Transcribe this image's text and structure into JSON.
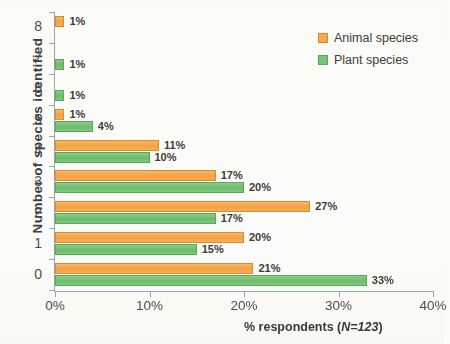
{
  "chart_data": {
    "type": "bar",
    "orientation": "horizontal",
    "title": "",
    "xlabel": "% respondents (N=123)",
    "xlabel_plain": "% respondents (",
    "xlabel_italic": "N=123",
    "xlabel_tail": ")",
    "ylabel": "Number of species identified",
    "categories": [
      "0",
      "1",
      "2",
      "3",
      "4",
      "5",
      "6",
      "7",
      "8"
    ],
    "xlim": [
      0,
      40
    ],
    "xticks": [
      0,
      10,
      20,
      30,
      40
    ],
    "xtick_labels": [
      "0%",
      "10%",
      "20%",
      "30%",
      "40%"
    ],
    "ytick_labels": [
      "8",
      "7",
      "6",
      "5",
      "4",
      "3",
      "2",
      "1",
      "0"
    ],
    "grid": false,
    "legend_position": "top-right",
    "series": [
      {
        "name": "Animal species",
        "color": "#F6A94E",
        "values": [
          21,
          20,
          27,
          17,
          11,
          1,
          null,
          null,
          1
        ],
        "labels": [
          "21%",
          "20%",
          "27%",
          "17%",
          "11%",
          "1%",
          "",
          "",
          "1%"
        ]
      },
      {
        "name": "Plant species",
        "color": "#79C477",
        "values": [
          33,
          15,
          17,
          20,
          10,
          4,
          1,
          1,
          null
        ],
        "labels": [
          "33%",
          "15%",
          "17%",
          "20%",
          "10%",
          "4%",
          "1%",
          "1%",
          ""
        ]
      }
    ]
  },
  "legend": {
    "items": [
      {
        "label": "Animal species",
        "color": "#F6A94E"
      },
      {
        "label": "Plant species",
        "color": "#79C477"
      }
    ]
  },
  "axes": {
    "y_title": "Number  of  species  identified",
    "x_title_plain": "% respondents (",
    "x_title_italic": "N=123",
    "x_title_tail": ")"
  }
}
